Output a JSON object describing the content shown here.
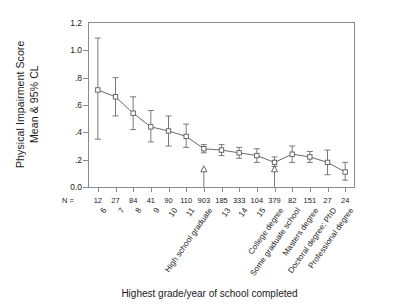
{
  "chart_data": {
    "type": "line",
    "title": "",
    "xlabel": "Highest grade/year of school completed",
    "ylabel": "Physical Impairment Score Mean & 95% CL",
    "ylabel_lines": [
      "Physical Impairment Score",
      "Mean & 95% CL"
    ],
    "ylim": [
      0.0,
      1.2
    ],
    "yticks": [
      0.0,
      0.2,
      0.4,
      0.6,
      0.8,
      1.0,
      1.2
    ],
    "ytick_labels": [
      "0.0",
      ".2",
      ".4",
      ".6",
      ".8",
      "1.0",
      "1.2"
    ],
    "grid": false,
    "legend": "none",
    "marker": "square-open",
    "errorbar": "95% CL",
    "n_label": "N =",
    "categories": [
      "6",
      "7",
      "8",
      "9",
      "10",
      "11",
      "High school graduate",
      "13",
      "14",
      "15",
      "College degree",
      "Some graduate school",
      "Masters degree",
      "Doctoral degree; PhD",
      "Professional degree"
    ],
    "n_values": [
      12,
      27,
      84,
      41,
      90,
      110,
      903,
      185,
      333,
      104,
      379,
      82,
      151,
      27,
      24
    ],
    "values": [
      0.71,
      0.66,
      0.54,
      0.44,
      0.41,
      0.37,
      0.28,
      0.27,
      0.25,
      0.23,
      0.18,
      0.24,
      0.22,
      0.18,
      0.11
    ],
    "ci_lower": [
      0.35,
      0.52,
      0.42,
      0.33,
      0.3,
      0.29,
      0.25,
      0.23,
      0.21,
      0.18,
      0.15,
      0.18,
      0.18,
      0.09,
      0.05
    ],
    "ci_upper": [
      1.09,
      0.8,
      0.66,
      0.56,
      0.52,
      0.46,
      0.31,
      0.31,
      0.29,
      0.28,
      0.22,
      0.3,
      0.26,
      0.27,
      0.18
    ],
    "annotations": [
      {
        "label": "High school graduate",
        "marker": "triangle-up",
        "category_index": 6
      },
      {
        "label": "College degree",
        "marker": "triangle-up",
        "category_index": 10
      }
    ],
    "colors": {
      "line": "#595959",
      "marker": "#595959",
      "axis": "#8a8a8a",
      "text": "#1a1a1a"
    }
  }
}
